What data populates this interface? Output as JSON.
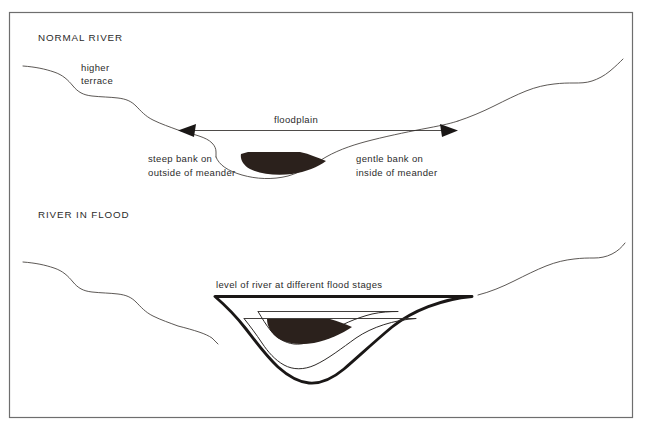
{
  "figure": {
    "frame": {
      "x": 9,
      "y": 12,
      "width": 624,
      "height": 406,
      "border_color": "#6e6e6e"
    },
    "colors": {
      "terrain_line": "#4a4542",
      "channel_line": "#2e2a28",
      "heavy_line": "#1a1716",
      "water_fill": "#2b211c",
      "text": "#2b2b2b",
      "background": "#ffffff"
    }
  },
  "panels": [
    {
      "id": "normal-river",
      "heading": "NORMAL RIVER",
      "labels": [
        {
          "id": "higher-terrace",
          "lines": [
            "higher",
            "terrace"
          ]
        },
        {
          "id": "floodplain",
          "lines": [
            "floodplain"
          ]
        },
        {
          "id": "steep-bank",
          "lines": [
            "steep bank on",
            "outside of meander"
          ]
        },
        {
          "id": "gentle-bank",
          "lines": [
            "gentle bank on",
            "inside of meander"
          ]
        }
      ],
      "annotations": {
        "floodplain_extent_arrow": "double-headed horizontal arrow spanning the floodplain width"
      }
    },
    {
      "id": "river-in-flood",
      "heading": "RIVER IN FLOOD",
      "labels": [
        {
          "id": "flood-stages",
          "lines": [
            "level of river at different flood stages"
          ]
        }
      ],
      "annotations": {
        "flood_stage_count": 3,
        "stage_description": "Three nested channel outlines show low, intermediate and peak flood water levels"
      }
    }
  ]
}
